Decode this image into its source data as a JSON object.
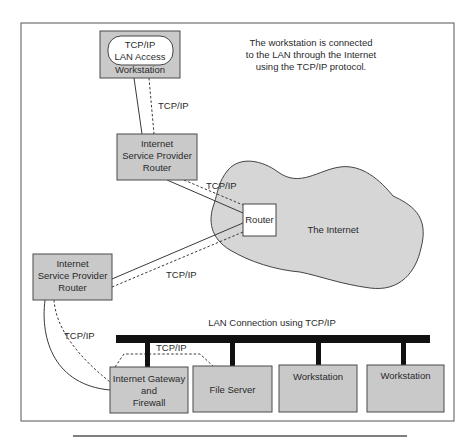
{
  "caption": {
    "line1": "The workstation is connected",
    "line2": "to the LAN through the Internet",
    "line3": "using the TCP/IP protocol."
  },
  "nodes": {
    "remote_workstation": {
      "oval_line1": "TCP/IP",
      "oval_line2": "LAN Access",
      "label": "Workstation"
    },
    "isp_router_1": {
      "line1": "Internet",
      "line2": "Service Provider",
      "line3": "Router"
    },
    "isp_router_2": {
      "line1": "Internet",
      "line2": "Service Provider",
      "line3": "Router"
    },
    "internet_router": {
      "label": "Router"
    },
    "internet_cloud": {
      "label": "The Internet"
    },
    "gateway": {
      "line1": "Internet Gateway",
      "line2": "and",
      "line3": "Firewall"
    },
    "file_server": {
      "label": "File Server"
    },
    "lan_workstation_1": {
      "label": "Workstation"
    },
    "lan_workstation_2": {
      "label": "Workstation"
    }
  },
  "links": {
    "ws_to_isp1": "TCP/IP",
    "isp1_to_router": "TCP/IP",
    "router_to_isp2": "TCP/IP",
    "isp2_to_gateway": "TCP/IP",
    "gateway_to_fileserver": "TCP/IP"
  },
  "lan": {
    "label": "LAN Connection using TCP/IP"
  },
  "colors": {
    "box_fill": "#c9c9c9",
    "cloud_fill": "#d6d6d6",
    "line": "#3a3a3a",
    "lan_bus": "#111111"
  }
}
